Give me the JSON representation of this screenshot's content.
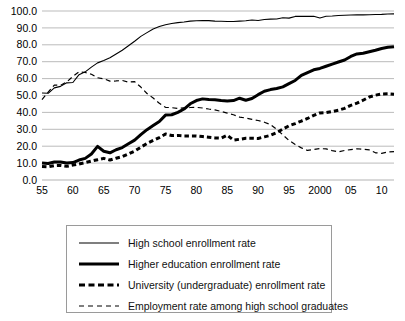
{
  "chart_data": {
    "type": "line",
    "title": "",
    "subtitle": "",
    "xlabel": "",
    "ylabel": "",
    "xlim": [
      1955,
      2012
    ],
    "ylim": [
      0.0,
      100.0
    ],
    "grid": true,
    "legend_position": "bottom",
    "y_ticks": [
      "0.0",
      "10.0",
      "20.0",
      "30.0",
      "40.0",
      "50.0",
      "60.0",
      "70.0",
      "80.0",
      "90.0",
      "100.0"
    ],
    "y_tick_values": [
      0,
      10,
      20,
      30,
      40,
      50,
      60,
      70,
      80,
      90,
      100
    ],
    "x_ticks": [
      "55",
      "60",
      "65",
      "70",
      "75",
      "80",
      "85",
      "90",
      "95",
      "2000",
      "05",
      "10"
    ],
    "x_tick_values": [
      1955,
      1960,
      1965,
      1970,
      1975,
      1980,
      1985,
      1990,
      1995,
      2000,
      2005,
      2010
    ],
    "x": [
      1955,
      1956,
      1957,
      1958,
      1959,
      1960,
      1961,
      1962,
      1963,
      1964,
      1965,
      1966,
      1967,
      1968,
      1969,
      1970,
      1971,
      1972,
      1973,
      1974,
      1975,
      1976,
      1977,
      1978,
      1979,
      1980,
      1981,
      1982,
      1983,
      1984,
      1985,
      1986,
      1987,
      1988,
      1989,
      1990,
      1991,
      1992,
      1993,
      1994,
      1995,
      1996,
      1997,
      1998,
      1999,
      2000,
      2001,
      2002,
      2003,
      2004,
      2005,
      2006,
      2007,
      2008,
      2009,
      2010,
      2011,
      2012
    ],
    "series": [
      {
        "name": "High school enrollment rate",
        "style": "thin-solid",
        "color": "#000000",
        "values": [
          51.5,
          51.3,
          54.5,
          55.4,
          57.5,
          57.7,
          62.3,
          64.0,
          66.8,
          69.3,
          70.7,
          72.3,
          74.5,
          76.8,
          79.4,
          82.1,
          85.0,
          87.2,
          89.4,
          90.8,
          91.9,
          92.6,
          93.1,
          93.5,
          94.0,
          94.2,
          94.3,
          94.3,
          94.0,
          93.9,
          93.8,
          93.8,
          94.0,
          94.2,
          94.7,
          94.4,
          95.0,
          95.2,
          95.3,
          96.0,
          95.8,
          96.8,
          96.8,
          96.8,
          96.9,
          95.9,
          96.9,
          97.0,
          97.3,
          97.5,
          97.6,
          97.7,
          97.7,
          97.8,
          97.9,
          98.0,
          98.2,
          98.3
        ]
      },
      {
        "name": "Higher education enrollment rate",
        "style": "thick-solid",
        "color": "#000000",
        "values": [
          10.1,
          9.8,
          10.7,
          10.7,
          10.1,
          10.3,
          11.8,
          12.8,
          15.4,
          19.9,
          17.0,
          16.1,
          17.9,
          19.2,
          21.4,
          23.6,
          26.8,
          29.8,
          32.2,
          34.6,
          38.4,
          38.6,
          40.0,
          42.0,
          45.1,
          47.0,
          48.0,
          47.6,
          47.5,
          47.0,
          46.8,
          47.0,
          48.4,
          47.2,
          48.2,
          50.5,
          52.5,
          53.5,
          54.1,
          55.1,
          57.0,
          58.9,
          61.9,
          63.6,
          65.2,
          66.0,
          67.3,
          68.6,
          69.8,
          71.0,
          73.1,
          74.6,
          75.0,
          75.9,
          76.8,
          77.8,
          78.5,
          78.9
        ]
      },
      {
        "name": "University (undergraduate) enrollment rate",
        "style": "thick-dashed",
        "color": "#000000",
        "values": [
          8.0,
          7.8,
          8.5,
          8.6,
          8.1,
          8.8,
          9.5,
          10.3,
          11.2,
          12.0,
          12.8,
          11.8,
          12.9,
          13.8,
          15.4,
          17.1,
          19.4,
          21.6,
          23.4,
          25.1,
          27.2,
          26.3,
          26.4,
          26.1,
          26.1,
          26.1,
          25.7,
          25.3,
          24.9,
          24.8,
          26.5,
          23.6,
          24.1,
          24.7,
          24.7,
          24.6,
          25.5,
          26.4,
          28.0,
          30.1,
          32.1,
          33.4,
          34.9,
          36.4,
          38.2,
          39.7,
          39.9,
          40.5,
          41.3,
          42.4,
          44.2,
          45.5,
          47.2,
          49.1,
          50.2,
          50.9,
          51.0,
          50.8
        ]
      },
      {
        "name": "Employment rate among high school graduates",
        "style": "thin-dashed",
        "color": "#000000",
        "values": [
          47.6,
          52.0,
          56.2,
          56.0,
          58.0,
          61.3,
          64.0,
          63.6,
          62.6,
          60.5,
          59.9,
          58.5,
          58.6,
          58.9,
          57.9,
          58.2,
          55.0,
          51.2,
          48.5,
          45.4,
          43.0,
          42.8,
          42.3,
          42.7,
          42.9,
          43.0,
          42.6,
          42.0,
          41.5,
          40.6,
          39.6,
          38.6,
          37.2,
          36.7,
          35.9,
          35.2,
          34.2,
          32.8,
          30.0,
          26.7,
          23.4,
          21.0,
          19.0,
          17.5,
          18.0,
          18.6,
          18.4,
          17.4,
          16.7,
          17.5,
          18.0,
          18.5,
          18.2,
          17.8,
          16.1,
          15.8,
          16.6,
          16.8
        ]
      }
    ]
  },
  "legend": {
    "items": [
      {
        "label": "High school enrollment rate",
        "style": "thin-solid"
      },
      {
        "label": "Higher education enrollment rate",
        "style": "thick-solid"
      },
      {
        "label": "University (undergraduate) enrollment rate",
        "style": "thick-dashed"
      },
      {
        "label": "Employment rate among high school graduates",
        "style": "thin-dashed"
      }
    ]
  },
  "colors": {
    "line": "#000000",
    "grid": "#b3b3b3",
    "legend_border": "#9a9a9a",
    "background": "#ffffff"
  }
}
